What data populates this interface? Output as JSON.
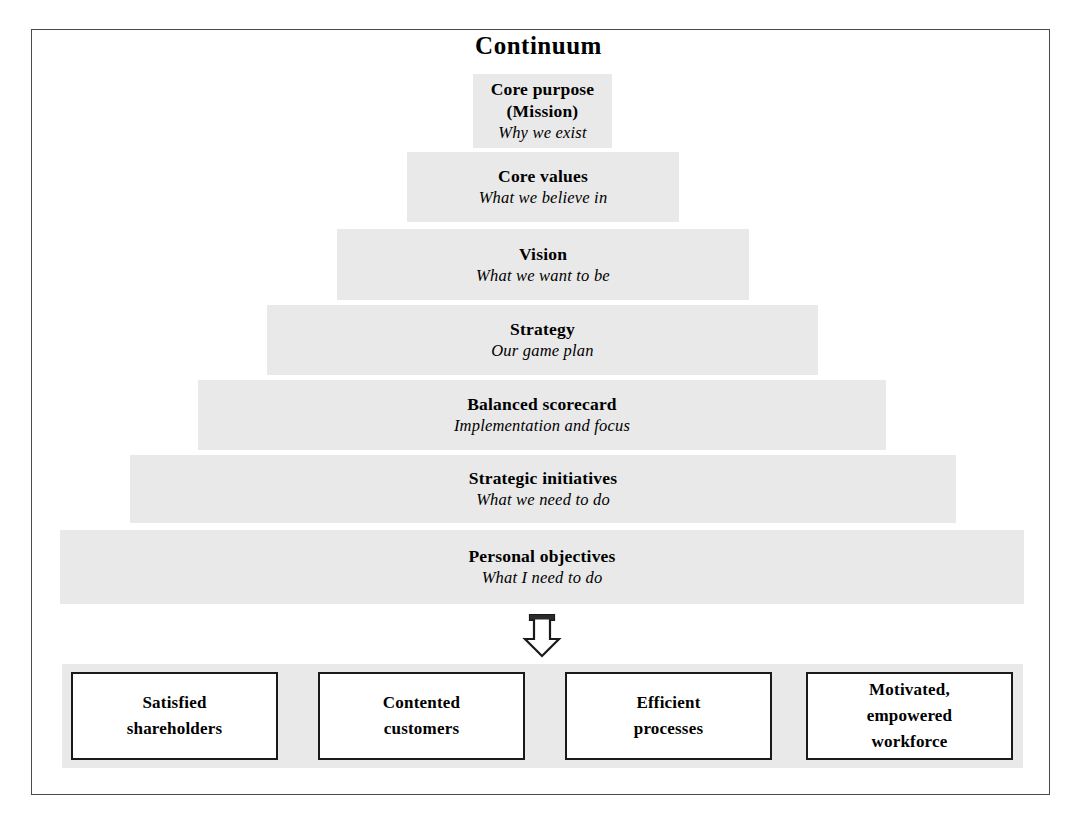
{
  "diagram": {
    "title": "Continuum",
    "levels": [
      {
        "name": "Core purpose (Mission)",
        "title_lines": [
          "Core purpose",
          "(Mission)"
        ],
        "subtitle": "Why we exist",
        "left": 473,
        "top": 74,
        "width": 139,
        "height": 74
      },
      {
        "name": "Core values",
        "title_lines": [
          "Core values"
        ],
        "subtitle": "What we believe in",
        "left": 407,
        "top": 152,
        "width": 272,
        "height": 70
      },
      {
        "name": "Vision",
        "title_lines": [
          "Vision"
        ],
        "subtitle": "What we want to be",
        "left": 337,
        "top": 229,
        "width": 412,
        "height": 71
      },
      {
        "name": "Strategy",
        "title_lines": [
          "Strategy"
        ],
        "subtitle": "Our game plan",
        "left": 267,
        "top": 305,
        "width": 551,
        "height": 70
      },
      {
        "name": "Balanced scorecard",
        "title_lines": [
          "Balanced scorecard"
        ],
        "subtitle": "Implementation and focus",
        "left": 198,
        "top": 380,
        "width": 688,
        "height": 70
      },
      {
        "name": "Strategic initiatives",
        "title_lines": [
          "Strategic initiatives"
        ],
        "subtitle": "What we need to do",
        "left": 130,
        "top": 455,
        "width": 826,
        "height": 68
      },
      {
        "name": "Personal objectives",
        "title_lines": [
          "Personal objectives"
        ],
        "subtitle": "What I need to do",
        "left": 60,
        "top": 530,
        "width": 964,
        "height": 74
      }
    ],
    "arrow": {
      "icon": "down-arrow-icon",
      "direction": "down"
    },
    "outcomes": [
      {
        "name": "Satisfied shareholders",
        "lines": [
          "Satisfied",
          "shareholders"
        ],
        "left": 71,
        "width": 207
      },
      {
        "name": "Contented customers",
        "lines": [
          "Contented",
          "customers"
        ],
        "left": 318,
        "width": 207
      },
      {
        "name": "Efficient processes",
        "lines": [
          "Efficient",
          "processes"
        ],
        "left": 565,
        "width": 207
      },
      {
        "name": "Motivated, empowered workforce",
        "lines": [
          "Motivated,",
          "empowered",
          "workforce"
        ],
        "left": 806,
        "width": 207
      }
    ]
  },
  "colors": {
    "band_fill": "#e9e9e9",
    "strip_fill": "#e9e9e9",
    "frame_border": "#4a4a4a",
    "box_border": "#1a1a1a",
    "text": "#000000",
    "page_background": "#ffffff"
  }
}
